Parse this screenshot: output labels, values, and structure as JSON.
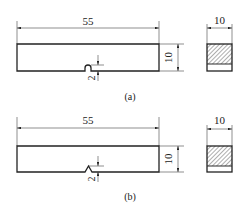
{
  "figure_a": {
    "label": "(a)",
    "length_dim": "55",
    "height_dim": "10",
    "notch_depth_dim": "2",
    "section_width_dim": "10",
    "notch_type": "U-notch"
  },
  "figure_b": {
    "label": "(b)",
    "length_dim": "55",
    "height_dim": "10",
    "notch_depth_dim": "2",
    "section_width_dim": "10",
    "notch_type": "V-notch"
  },
  "colors": {
    "line": "#2a2a2a",
    "background": "#ffffff"
  }
}
